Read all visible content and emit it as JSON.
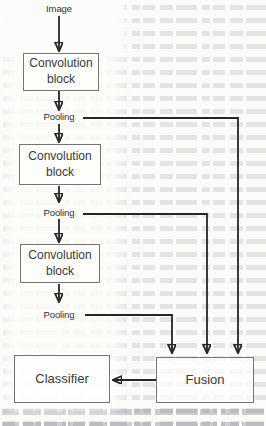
{
  "figure": {
    "type": "flowchart",
    "nodes": {
      "input_label": "Image",
      "conv_block_1": "Convolution block",
      "pool_1": "Pooling",
      "conv_block_2": "Convolution block",
      "pool_2": "Pooling",
      "conv_block_3": "Convolution block",
      "pool_3": "Pooling",
      "fusion": "Fusion",
      "classifier": "Classifier"
    },
    "edges": [
      "Image -> Convolution block 1",
      "Convolution block 1 -> Pooling 1",
      "Pooling 1 -> Convolution block 2",
      "Pooling 1 -> Fusion",
      "Convolution block 2 -> Pooling 2",
      "Pooling 2 -> Convolution block 3",
      "Pooling 2 -> Fusion",
      "Convolution block 3 -> Pooling 3",
      "Pooling 3 -> Fusion",
      "Fusion -> Classifier"
    ],
    "colors": {
      "page_background": "#fbfbf9",
      "box_border": "#757575",
      "arrow": "#262626",
      "label_text": "#3a3a3a"
    }
  }
}
